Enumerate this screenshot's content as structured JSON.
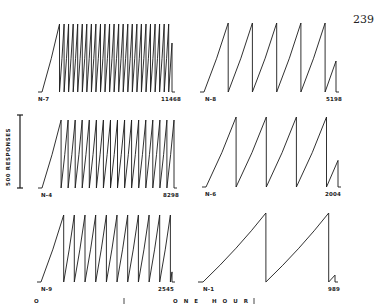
{
  "page_number": "239",
  "y_axis_label": "500 RESPONSES",
  "time_scale_label": "ONE HOUR",
  "scale_left_mark": "O",
  "chart_data": {
    "type": "line",
    "ylabel": "500 RESPONSES",
    "xlabel": "ONE HOUR",
    "grid": false,
    "panels": [
      {
        "position": "top-left",
        "subject": "N-7",
        "total_responses": "11468",
        "resets": 25,
        "full_scale_responses": 500
      },
      {
        "position": "top-right",
        "subject": "N-8",
        "total_responses": "5198",
        "resets": 5,
        "full_scale_responses": 500
      },
      {
        "position": "middle-left",
        "subject": "N-4",
        "total_responses": "8298",
        "resets": 17,
        "full_scale_responses": 500
      },
      {
        "position": "middle-right",
        "subject": "N-6",
        "total_responses": "2004",
        "resets": 4,
        "full_scale_responses": 500
      },
      {
        "position": "bottom-left",
        "subject": "N-9",
        "total_responses": "2545",
        "resets": 11,
        "full_scale_responses": 500
      },
      {
        "position": "bottom-right",
        "subject": "N-1",
        "total_responses": "989",
        "resets": 2,
        "full_scale_responses": 500
      }
    ]
  },
  "panels": {
    "tl": {
      "subject": "N-7",
      "total": "11468"
    },
    "tr": {
      "subject": "N-8",
      "total": "5198"
    },
    "ml": {
      "subject": "N-4",
      "total": "8298"
    },
    "mr": {
      "subject": "N-6",
      "total": "2004"
    },
    "bl": {
      "subject": "N-9",
      "total": "2545"
    },
    "br": {
      "subject": "N-1",
      "total": "989"
    }
  },
  "colors": {
    "ink": "#1a1a1a",
    "paper": "#ffffff"
  }
}
